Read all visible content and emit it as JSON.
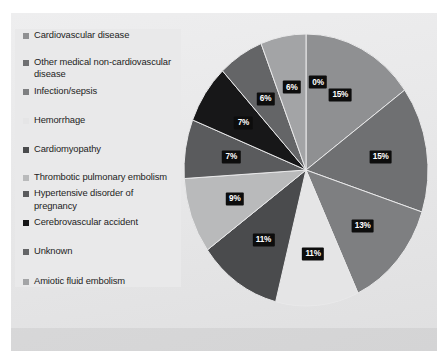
{
  "chart_data": {
    "type": "pie",
    "title": "",
    "legend_position": "left",
    "categories": [
      "Cardiovascular disease",
      "Other medical non-cardiovascular disease",
      "Infection/sepsis",
      "Hemorrhage",
      "Cardiomyopathy",
      "Thrombotic pulmonary embolism",
      "Hypertensive disorder of pregnancy",
      "Cerebrovascular accident",
      "Unknown",
      "Amiotic fluid embolism"
    ],
    "values": [
      15,
      15,
      13,
      11,
      11,
      9,
      7,
      7,
      6,
      6
    ],
    "data_labels": [
      "15%",
      "15%",
      "13%",
      "11%",
      "11%",
      "9%",
      "7%",
      "7%",
      "6%",
      "6%"
    ],
    "extra_label": "0%",
    "colors": [
      "#8f9092",
      "#6f7072",
      "#7e7f81",
      "#e5e5e6",
      "#4a4b4d",
      "#b9babb",
      "#5a5b5d",
      "#171718",
      "#646567",
      "#a3a4a6"
    ],
    "slices": [
      {
        "label": "Cardiovascular disease",
        "value": 15,
        "display": "15%",
        "color": "#8f9092"
      },
      {
        "label": "Other medical non-cardiovascular disease",
        "value": 15,
        "display": "15%",
        "color": "#6f7072"
      },
      {
        "label": "Infection/sepsis",
        "value": 13,
        "display": "13%",
        "color": "#7e7f81"
      },
      {
        "label": "Hemorrhage",
        "value": 11,
        "display": "11%",
        "color": "#e5e5e6"
      },
      {
        "label": "Cardiomyopathy",
        "value": 11,
        "display": "11%",
        "color": "#4a4b4d"
      },
      {
        "label": "Thrombotic pulmonary embolism",
        "value": 9,
        "display": "9%",
        "color": "#b9babb"
      },
      {
        "label": "Hypertensive disorder of pregnancy",
        "value": 7,
        "display": "7%",
        "color": "#5a5b5d"
      },
      {
        "label": "Cerebrovascular accident",
        "value": 7,
        "display": "7%",
        "color": "#171718"
      },
      {
        "label": "Unknown",
        "value": 6,
        "display": "6%",
        "color": "#646567"
      },
      {
        "label": "Amiotic fluid embolism",
        "value": 6,
        "display": "6%",
        "color": "#a3a4a6"
      }
    ]
  },
  "legend": {
    "items": [
      {
        "label": "Cardiovascular disease",
        "color": "#8f9092"
      },
      {
        "label": "Other medical non-cardiovascular disease",
        "color": "#6f7072"
      },
      {
        "label": "Infection/sepsis",
        "color": "#7e7f81"
      },
      {
        "label": "Hemorrhage",
        "color": "#e5e5e6"
      },
      {
        "label": "Cardiomyopathy",
        "color": "#4a4b4d"
      },
      {
        "label": "Thrombotic pulmonary embolism",
        "color": "#b9babb"
      },
      {
        "label": "Hypertensive disorder of pregnancy",
        "color": "#5a5b5d"
      },
      {
        "label": "Cerebrovascular accident",
        "color": "#171718"
      },
      {
        "label": "Unknown",
        "color": "#646567"
      },
      {
        "label": "Amiotic fluid embolism",
        "color": "#a3a4a6"
      }
    ]
  }
}
